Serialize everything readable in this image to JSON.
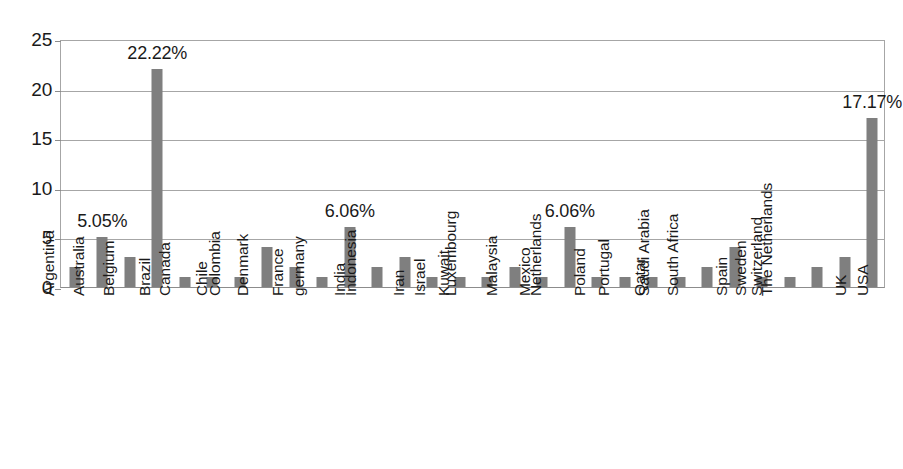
{
  "chart_data": {
    "type": "bar",
    "title": "",
    "subtitle": "",
    "xlabel": "",
    "ylabel": "",
    "ylim": [
      0,
      25
    ],
    "ytick_values": [
      0,
      5,
      10,
      15,
      20,
      25
    ],
    "ytick_labels": [
      "0",
      "5",
      "10",
      "15",
      "20",
      "25"
    ],
    "grid": true,
    "legend": false,
    "legend_position": "none",
    "bar_color": "#7f7f7f",
    "gridline_color": "#a6a6a6",
    "axis_color": "#8c8c8c",
    "background": "#ffffff",
    "categories": [
      "Argentina",
      "Australia",
      "Belgium",
      "Brazil",
      "Canada",
      "Chile",
      "Colombia",
      "Denmark",
      "France",
      "germany",
      "India",
      "Indonesia",
      "Iran",
      "Israel",
      "Kuwait",
      "Luxembourg",
      "Malaysia",
      "Mexico",
      "Netherlands",
      "Poland",
      "Portugal",
      "Qatar",
      "Saudi Arabia",
      "South Africa",
      "Spain",
      "Sweden",
      "Switzerland",
      "The Netherlands",
      "UK",
      "USA"
    ],
    "values": [
      2,
      5,
      3,
      22,
      1,
      1,
      1,
      4,
      2,
      1,
      6,
      2,
      3,
      1,
      1,
      1,
      2,
      1,
      6,
      1,
      1,
      1,
      1,
      2,
      4,
      1,
      1,
      2,
      3,
      17
    ],
    "point_labels": [
      {
        "category": "Australia",
        "value": 5,
        "text": "5.05%"
      },
      {
        "category": "Brazil",
        "value": 22,
        "text": "22.22%"
      },
      {
        "category": "India",
        "value": 6,
        "text": "6.06%"
      },
      {
        "category": "Netherlands",
        "value": 6,
        "text": "6.06%"
      },
      {
        "category": "USA",
        "value": 17,
        "text": "17.17%"
      }
    ]
  }
}
